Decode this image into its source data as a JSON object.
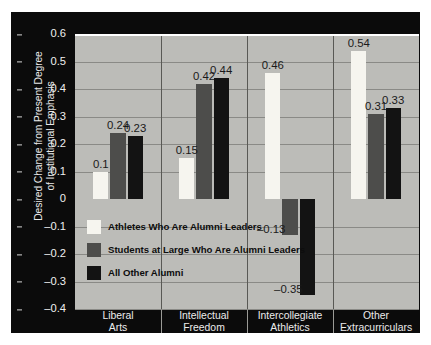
{
  "chart_data": {
    "type": "bar",
    "title": "",
    "xlabel": "",
    "ylabel": "Desired Change from Present Degree of Institutional Emphasis",
    "ylabel_lines": [
      "Desired Change from Present Degree",
      "of Institutional Emphasis"
    ],
    "ylim": [
      -0.4,
      0.6
    ],
    "ytick_labels": [
      "0.6",
      "0.5",
      "0.4",
      "0.3",
      "0.2",
      "0.1",
      "0",
      "–0.1",
      "–0.2",
      "–0.3",
      "–0.4"
    ],
    "ytick_values": [
      0.6,
      0.5,
      0.4,
      0.3,
      0.2,
      0.1,
      0,
      -0.1,
      -0.2,
      -0.3,
      -0.4
    ],
    "grid": true,
    "legend_position": "inside-lower-left",
    "categories": [
      "Liberal Arts",
      "Intellectual Freedom",
      "Intercollegiate Athletics",
      "Other Extracurriculars"
    ],
    "category_lines": [
      [
        "Liberal",
        "Arts"
      ],
      [
        "Intellectual",
        "Freedom"
      ],
      [
        "Intercollegiate",
        "Athletics"
      ],
      [
        "Other",
        "Extracurriculars"
      ]
    ],
    "series": [
      {
        "name": "Athletes Who Are Alumni Leaders",
        "color": "#f6f5ef",
        "values": [
          0.1,
          0.15,
          0.46,
          0.54
        ],
        "labels": [
          "0.1",
          "0.15",
          "0.46",
          "0.54"
        ]
      },
      {
        "name": "Students at Large Who Are Alumni Leaders",
        "color": "#4d4d4b",
        "values": [
          0.24,
          0.42,
          -0.13,
          0.31
        ],
        "labels": [
          "0.24",
          "0.42",
          "–0.13",
          "0.31"
        ]
      },
      {
        "name": "All Other Alumni",
        "color": "#131313",
        "values": [
          0.23,
          0.44,
          -0.35,
          0.33
        ],
        "labels": [
          "0.23",
          "0.44",
          "–0.35",
          "0.33"
        ]
      }
    ],
    "colors": {
      "figure_background": "#0b0b0b",
      "plot_background": "#bcbcb8",
      "gridline": "#8a8a86",
      "zero_line": "#ffffff",
      "axis_text": "#ececec",
      "data_label": "#1a1a1a"
    }
  }
}
